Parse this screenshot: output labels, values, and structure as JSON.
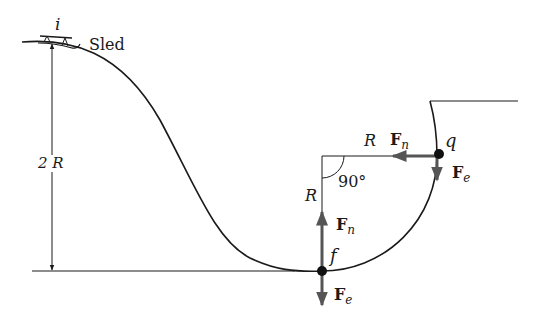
{
  "labels": {
    "start_point": "i",
    "sled": "Sled",
    "height": "2 R",
    "radius_horizontal": "R",
    "radius_vertical": "R",
    "angle": "90°",
    "point_top": "q",
    "point_bottom": "f"
  },
  "forces": {
    "top": {
      "normal": {
        "main": "F",
        "sub": "n"
      },
      "weight": {
        "main": "F",
        "sub": "e"
      }
    },
    "bottom": {
      "normal": {
        "main": "F",
        "sub": "n"
      },
      "weight": {
        "main": "F",
        "sub": "e"
      }
    }
  },
  "colors": {
    "line": "#1a1a1a",
    "force_arrow": "#555555"
  }
}
